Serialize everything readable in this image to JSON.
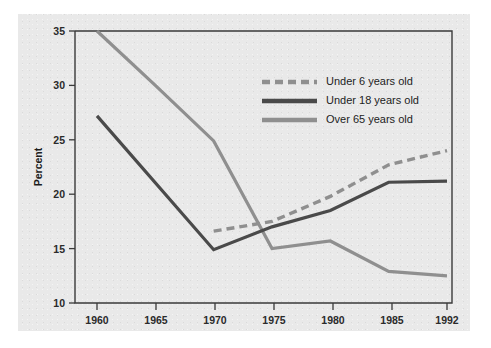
{
  "chart_data": {
    "type": "line",
    "title": "",
    "subtitle": "",
    "xlabel": "",
    "ylabel": "Percent",
    "categories": [
      "1960",
      "1965",
      "1970",
      "1975",
      "1980",
      "1985",
      "1992"
    ],
    "x_tick_labels": [
      "1960",
      "1965",
      "1970",
      "1975",
      "1980",
      "1985",
      "1992"
    ],
    "y_tick_labels": [
      "10",
      "15",
      "20",
      "25",
      "30",
      "35"
    ],
    "y_ticks": [
      10,
      15,
      20,
      25,
      30,
      35
    ],
    "ylim": [
      10,
      35
    ],
    "grid": false,
    "legend_position": "upper-center-right",
    "series": [
      {
        "name": "Under 6 years old",
        "style": "dashed",
        "color": "#8f8f8f",
        "x": [
          "1970",
          "1975",
          "1980",
          "1985",
          "1992"
        ],
        "values": [
          16.6,
          17.5,
          19.8,
          22.7,
          24.0
        ]
      },
      {
        "name": "Under 18 years old",
        "style": "solid",
        "color": "#4a4a4a",
        "x": [
          "1960",
          "1970",
          "1975",
          "1980",
          "1985",
          "1992"
        ],
        "values": [
          27.2,
          14.9,
          17.0,
          18.5,
          21.1,
          21.2
        ]
      },
      {
        "name": "Over 65 years old",
        "style": "solid",
        "color": "#8f8f8f",
        "x": [
          "1960",
          "1965",
          "1970",
          "1975",
          "1980",
          "1985",
          "1992"
        ],
        "values": [
          35.0,
          30.0,
          24.9,
          15.0,
          15.7,
          12.9,
          12.5
        ]
      }
    ]
  },
  "legend": {
    "items": [
      {
        "label": "Under 6 years old"
      },
      {
        "label": "Under 18 years old"
      },
      {
        "label": "Over 65 years old"
      }
    ]
  },
  "colors": {
    "dashed_series": "#8f8f8f",
    "dark_series": "#4a4a4a",
    "gray_series": "#8f8f8f",
    "axis": "#3a3a3a",
    "panel_background": "#e9e9e9",
    "text": "#1d1d1d"
  }
}
